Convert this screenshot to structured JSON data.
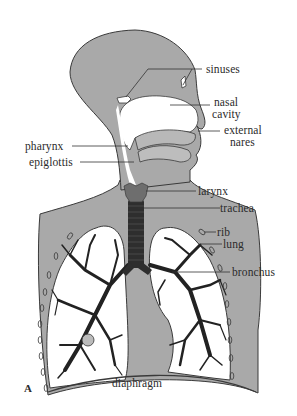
{
  "figure": {
    "panel_label": "A",
    "colors": {
      "body_fill": "#a9a9a9",
      "outline": "#3a3a3a",
      "airway_dark": "#2e2e2e",
      "larynx": "#6e6e6e",
      "lung_fill": "#ffffff",
      "label_text": "#2b2b2b"
    }
  },
  "labels": {
    "sinuses": "sinuses",
    "nasal_cavity_1": "nasal",
    "nasal_cavity_2": "cavity",
    "external_nares_1": "external",
    "external_nares_2": "nares",
    "pharynx": "pharynx",
    "epiglottis": "epiglottis",
    "larynx": "larynx",
    "trachea": "trachea",
    "rib": "rib",
    "lung": "lung",
    "bronchus": "bronchus",
    "diaphragm": "diaphragm"
  }
}
